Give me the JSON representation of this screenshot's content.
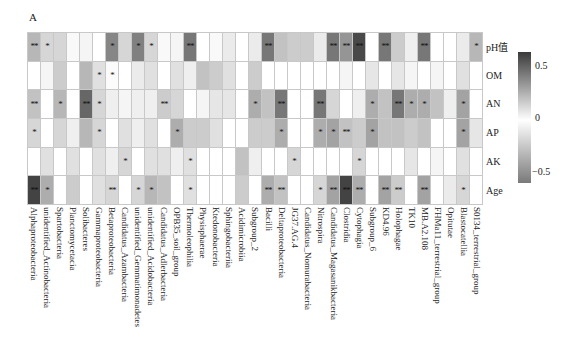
{
  "panel_label": "A",
  "chart_data": {
    "type": "heatmap",
    "title": "",
    "panel": "A",
    "rows": [
      "pH值",
      "OM",
      "AN",
      "AP",
      "AK",
      "Age"
    ],
    "columns": [
      "Alphaproteobacteria",
      "unidentified_Actinobacteria",
      "Spartobacteria",
      "Planctomycetacia",
      "Solibacteres",
      "Gammaproteobacteria",
      "Betaproteobacteria",
      "Candidatus_Azambacteria",
      "unidentified_Gemmatimonadetes",
      "unidentified_Acidobacteria",
      "Candidatus_Adlerbacteria",
      "OPB35_soil_group",
      "Thermoleophilia",
      "Physisphaerae",
      "Ktedonobacteria",
      "Sphingobacteriia",
      "Acidimicrobiia",
      "Subgroup_2",
      "Bacilli",
      "Deltaproteobacteria",
      "JG37.AG.4",
      "Candidatus_Nomurabacteria",
      "Nitrospira",
      "Candidatus_Magasanikbacteria",
      "Clostridia",
      "Cytophagia",
      "Subgroup_6",
      "KD4.96",
      "Holophagae",
      "TK10",
      "MB.A2.108",
      "FHMa11_terrestrial_group",
      "Opitutae",
      "Blastocatellia",
      "S0134_terrestrial_group"
    ],
    "values": [
      [
        -0.35,
        -0.2,
        -0.2,
        0.02,
        -0.05,
        0.0,
        0.4,
        -0.2,
        0.42,
        -0.2,
        0.02,
        -0.05,
        0.45,
        0.0,
        0.02,
        -0.1,
        0.0,
        -0.1,
        0.45,
        -0.3,
        -0.25,
        -0.25,
        -0.1,
        0.45,
        0.35,
        0.6,
        0.0,
        0.45,
        -0.25,
        -0.08,
        0.45,
        0.0,
        0.0,
        -0.1,
        -0.35
      ],
      [
        0.0,
        -0.05,
        -0.25,
        0.0,
        -0.35,
        -0.15,
        -0.02,
        0.0,
        -0.1,
        -0.15,
        0.0,
        -0.15,
        -0.08,
        -0.3,
        -0.25,
        -0.15,
        0.0,
        -0.25,
        0.0,
        0.0,
        0.0,
        0.0,
        0.0,
        0.0,
        -0.05,
        0.0,
        -0.12,
        0.0,
        -0.12,
        -0.05,
        0.0,
        -0.05,
        0.0,
        -0.15,
        0.0
      ],
      [
        -0.3,
        0.0,
        -0.35,
        0.0,
        0.5,
        -0.2,
        -0.08,
        -0.05,
        -0.08,
        -0.08,
        -0.25,
        -0.2,
        0.0,
        -0.05,
        -0.12,
        -0.12,
        0.0,
        -0.4,
        -0.3,
        0.45,
        0.0,
        0.0,
        0.45,
        -0.2,
        0.0,
        -0.08,
        -0.4,
        -0.3,
        0.45,
        -0.4,
        -0.4,
        -0.3,
        -0.08,
        -0.45,
        0.0
      ],
      [
        -0.2,
        0.0,
        -0.2,
        -0.08,
        -0.35,
        -0.2,
        0.0,
        -0.15,
        -0.08,
        -0.15,
        0.0,
        -0.4,
        -0.25,
        -0.25,
        -0.15,
        0.0,
        0.0,
        -0.25,
        -0.25,
        -0.4,
        0.0,
        0.0,
        -0.4,
        -0.45,
        -0.3,
        -0.25,
        -0.45,
        -0.3,
        -0.3,
        -0.25,
        -0.3,
        0.0,
        0.0,
        -0.45,
        -0.12
      ],
      [
        0.0,
        -0.15,
        0.0,
        -0.15,
        0.0,
        -0.15,
        -0.08,
        -0.2,
        0.0,
        -0.15,
        -0.15,
        -0.08,
        -0.15,
        0.0,
        0.0,
        0.0,
        -0.3,
        -0.08,
        0.0,
        0.0,
        -0.2,
        0.0,
        0.0,
        0.0,
        0.0,
        -0.2,
        0.0,
        0.0,
        0.0,
        -0.12,
        0.0,
        -0.05,
        0.0,
        -0.15,
        0.0
      ],
      [
        0.62,
        -0.4,
        0.0,
        -0.25,
        0.0,
        -0.15,
        -0.2,
        0.0,
        -0.2,
        -0.35,
        -0.3,
        0.0,
        -0.15,
        0.0,
        0.0,
        0.0,
        -0.25,
        0.0,
        -0.4,
        -0.3,
        0.0,
        0.0,
        -0.2,
        -0.45,
        0.62,
        -0.4,
        0.0,
        -0.45,
        -0.25,
        0.0,
        -0.45,
        0.0,
        -0.1,
        -0.2,
        0.0
      ]
    ],
    "significance": [
      [
        "**",
        "*",
        "",
        "",
        "",
        "",
        "*",
        "",
        "*",
        "*",
        "",
        "",
        "**",
        "",
        "",
        "",
        "",
        "",
        "**",
        "",
        "",
        "",
        "",
        "**",
        "**",
        "**",
        "",
        "**",
        "",
        "",
        "**",
        "",
        "",
        "",
        "*"
      ],
      [
        "",
        "",
        "",
        "",
        "",
        "*",
        "*",
        "",
        "",
        "",
        "",
        "",
        "",
        "",
        "",
        "",
        "",
        "",
        "",
        "",
        "",
        "",
        "",
        "",
        "",
        "",
        "",
        "",
        "",
        "",
        "",
        "",
        "",
        "",
        ""
      ],
      [
        "**",
        "",
        "*",
        "",
        "**",
        "*",
        "",
        "",
        "",
        "",
        "**",
        "",
        "",
        "",
        "",
        "",
        "",
        "*",
        "",
        "**",
        "",
        "",
        "**",
        "",
        "",
        "",
        "*",
        "",
        "**",
        "*",
        "*",
        "",
        "",
        "*",
        ""
      ],
      [
        "*",
        "",
        "",
        "",
        "",
        "*",
        "",
        "",
        "",
        "",
        "",
        "*",
        "",
        "",
        "",
        "",
        "",
        "",
        "",
        "*",
        "",
        "",
        "*",
        "*",
        "**",
        "",
        "*",
        "",
        "",
        "",
        "",
        "",
        "",
        "*",
        ""
      ],
      [
        "",
        "",
        "",
        "",
        "",
        "",
        "",
        "*",
        "",
        "",
        "",
        "",
        "*",
        "",
        "",
        "",
        "",
        "",
        "",
        "",
        "*",
        "",
        "",
        "",
        "",
        "*",
        "",
        "",
        "",
        "",
        "",
        "",
        "",
        "",
        ""
      ],
      [
        "**",
        "*",
        "",
        "",
        "",
        "",
        "**",
        "",
        "*",
        "*",
        "",
        "",
        "*",
        "",
        "",
        "",
        "",
        "",
        "**",
        "**",
        "",
        "",
        "*",
        "**",
        "**",
        "**",
        "",
        "**",
        "**",
        "",
        "**",
        "",
        "",
        "*",
        ""
      ]
    ],
    "colorbar": {
      "ticks": [
        "0.5",
        "0",
        "−0.5"
      ],
      "range": [
        -0.65,
        0.65
      ],
      "colors": {
        "positive": "#3a3a3a",
        "zero": "#ffffff",
        "negative": "#7a7a7a"
      }
    },
    "legend_position": "right",
    "grid": true
  }
}
